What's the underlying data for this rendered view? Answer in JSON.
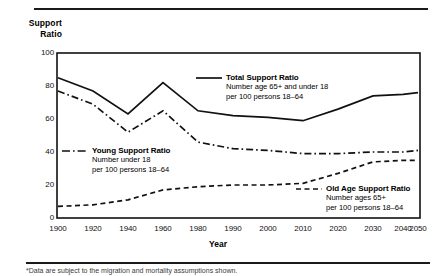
{
  "axis": {
    "y_title_line1": "Support",
    "y_title_line2": "Ratio",
    "x_title": "Year",
    "y_ticks": [
      "0",
      "20",
      "40",
      "60",
      "80",
      "100"
    ],
    "x_ticks": [
      "1900",
      "1920",
      "1940",
      "1960",
      "1980",
      "1990",
      "2000",
      "2010",
      "2020",
      "2030",
      "2040",
      "2050"
    ]
  },
  "legend": {
    "total": {
      "title": "Total Support Ratio",
      "line1": "Number age 65+ and under 18",
      "line2": "per 100 persons 18–64",
      "style": "solid"
    },
    "young": {
      "title": "Young Support Ratio",
      "line1": "Number under 18",
      "line2": "per 100 persons 18–64",
      "style": "dash-dot"
    },
    "old": {
      "title": "Old Age Support Ratio",
      "line1": "Number ages 65+",
      "line2": "per 100 persons 18–64",
      "style": "dashed"
    }
  },
  "footnote": "*Data are subject to the migration and mortality assumptions shown.",
  "colors": {
    "ink": "#111111",
    "background": "#ffffff"
  },
  "chart_data": {
    "type": "line",
    "title": "",
    "xlabel": "Year",
    "ylabel": "Support Ratio",
    "ylim": [
      0,
      100
    ],
    "grid": false,
    "legend_position": "inline-annotations",
    "x": [
      1900,
      1920,
      1940,
      1960,
      1980,
      1990,
      2000,
      2010,
      2020,
      2030,
      2040,
      2050
    ],
    "series": [
      {
        "name": "Total Support Ratio",
        "style": "solid",
        "values": [
          85,
          77,
          63,
          82,
          65,
          62,
          61,
          59,
          66,
          74,
          75,
          76
        ]
      },
      {
        "name": "Young Support Ratio",
        "style": "dash-dot",
        "values": [
          77,
          69,
          52,
          65,
          46,
          42,
          41,
          39,
          39,
          40,
          40,
          41
        ]
      },
      {
        "name": "Old Age Support Ratio",
        "style": "dashed",
        "values": [
          7,
          8,
          11,
          17,
          19,
          20,
          20,
          21,
          27,
          34,
          35,
          35
        ]
      }
    ]
  }
}
